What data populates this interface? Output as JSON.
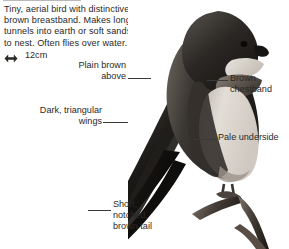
{
  "page": {
    "description": "Tiny, aerial bird with distinctive, brown breastband. Makes long tunnels into earth or soft sandstone to nest. Often flies over water.",
    "size": {
      "icon": "double-headed-arrow-icon",
      "value": "12cm"
    }
  },
  "photo": {
    "alt": "Perched brown and white martin on a bare twig",
    "colors": {
      "upperparts_dark": "#2a2724",
      "upperparts_mid": "#4a4541",
      "underside_pale": "#d8d3cc",
      "chestband": "#6b635b",
      "background": "#ffffff",
      "branch": "#5a5049"
    }
  },
  "labels": [
    {
      "key": "plain-brown-above",
      "text": "Plain brown\nabove",
      "align": "right"
    },
    {
      "key": "dark-triangular-wings",
      "text": "Dark, triangular\nwings",
      "align": "right"
    },
    {
      "key": "brown-chestband",
      "text": "Brown\nchestband",
      "align": "left"
    },
    {
      "key": "pale-underside",
      "text": "Pale underside",
      "align": "left"
    },
    {
      "key": "short-notched-brown-tail",
      "text": "Short,\nnotched,\nbrown tail",
      "align": "left"
    }
  ]
}
